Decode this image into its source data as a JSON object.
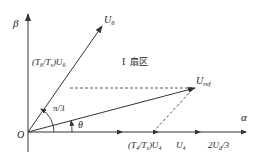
{
  "diagram": {
    "axes": {
      "y_label": "β",
      "x_label": "α",
      "origin_label": "O"
    },
    "vectors": {
      "u6_label": "U",
      "u6_sub": "6",
      "uref_label": "U",
      "uref_sub": "ref",
      "u4_label": "U",
      "u4_sub": "4",
      "two_ud_label": "2U",
      "two_ud_sub": "d",
      "two_ud_suffix": "/3"
    },
    "components": {
      "t6_prefix": "(T",
      "t6_sub": "6",
      "t6_mid": "/T",
      "t6_sub2": "s",
      "t6_close": ")U",
      "t6_sub3": "6",
      "t4_prefix": "(T",
      "t4_sub": "4",
      "t4_mid": "/T",
      "t4_sub2": "s",
      "t4_close": ")U",
      "t4_sub3": "4"
    },
    "angles": {
      "sector_angle": "π/3",
      "theta": "θ"
    },
    "sector": {
      "roman": "I",
      "text": "扇区"
    },
    "colors": {
      "line": "#333333",
      "background": "#ffffff"
    }
  }
}
